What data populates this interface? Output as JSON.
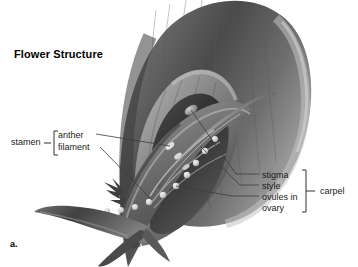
{
  "figure": {
    "title": "Flower Structure",
    "panel_letter": "a.",
    "style": "grayscale-botanical-illustration",
    "background_color": "#ffffff",
    "text_color": "#1a1a1a",
    "leader_line_color": "#3c3c3c"
  },
  "labels": {
    "stamen": "stamen",
    "anther": "anther",
    "filament": "filament",
    "stigma": "stigma",
    "style": "style",
    "ovules_in": "ovules in",
    "ovary": "ovary",
    "carpel": "carpel"
  },
  "brackets": [
    {
      "name": "stamen-bracket",
      "groups": [
        "anther",
        "filament"
      ],
      "side": "left"
    },
    {
      "name": "carpel-bracket",
      "groups": [
        "stigma",
        "style",
        "ovules in ovary"
      ],
      "side": "right"
    }
  ]
}
